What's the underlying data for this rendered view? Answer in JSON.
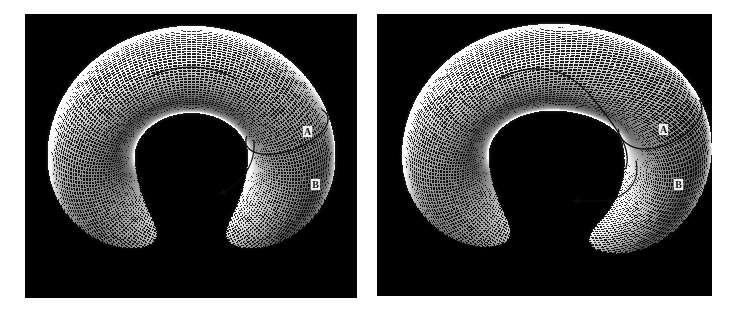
{
  "figure": {
    "background_color": "#fefefe",
    "panel_background_color": "#040404",
    "width": 735,
    "height": 313
  },
  "panels": [
    {
      "id": "left-panel",
      "name": "undeformed-torus",
      "caption": "",
      "x": 25,
      "y": 14,
      "width": 332,
      "height": 284,
      "surface": {
        "type": "torus",
        "major_radius": 0.7,
        "minor_radius": 0.3,
        "deformed": false,
        "twist_amplitude": 0.0,
        "mesh_u_steps": 150,
        "mesh_v_steps": 90,
        "wire_color": "#ffffff",
        "shading": "specular-dotted-mesh"
      },
      "labels": [
        {
          "text": "A",
          "x": 303,
          "y": 126
        },
        {
          "text": "B",
          "x": 311,
          "y": 179
        }
      ],
      "curves": [
        {
          "name": "curve-A",
          "kind": "longitude-loop",
          "color": "#101010",
          "arrow": true
        },
        {
          "name": "curve-B",
          "kind": "meridian-loop",
          "color": "#101010",
          "arrow": false
        }
      ]
    },
    {
      "id": "right-panel",
      "name": "deformed-torus",
      "caption": "",
      "x": 377,
      "y": 14,
      "width": 335,
      "height": 282,
      "surface": {
        "type": "torus",
        "major_radius": 0.7,
        "minor_radius": 0.3,
        "deformed": true,
        "twist_amplitude": 0.55,
        "mesh_u_steps": 150,
        "mesh_v_steps": 90,
        "wire_color": "#ffffff",
        "shading": "specular-dotted-mesh"
      },
      "labels": [
        {
          "text": "A",
          "x": 659,
          "y": 124
        },
        {
          "text": "B",
          "x": 674,
          "y": 179
        }
      ],
      "curves": [
        {
          "name": "curve-A",
          "kind": "longitude-loop",
          "color": "#101010",
          "arrow": true
        },
        {
          "name": "curve-B",
          "kind": "meridian-loop",
          "color": "#101010",
          "arrow": false
        }
      ]
    }
  ],
  "chart_data": {
    "type": "scatter",
    "xlabel": "",
    "ylabel": "",
    "legend": [
      "A",
      "B"
    ],
    "annotations": [
      "A",
      "B",
      "A",
      "B"
    ],
    "series": [
      {
        "name": "A",
        "description": "longitudinal generator loop around the major circle"
      },
      {
        "name": "B",
        "description": "meridional generator loop around the tube cross-section"
      }
    ],
    "grid": false
  }
}
